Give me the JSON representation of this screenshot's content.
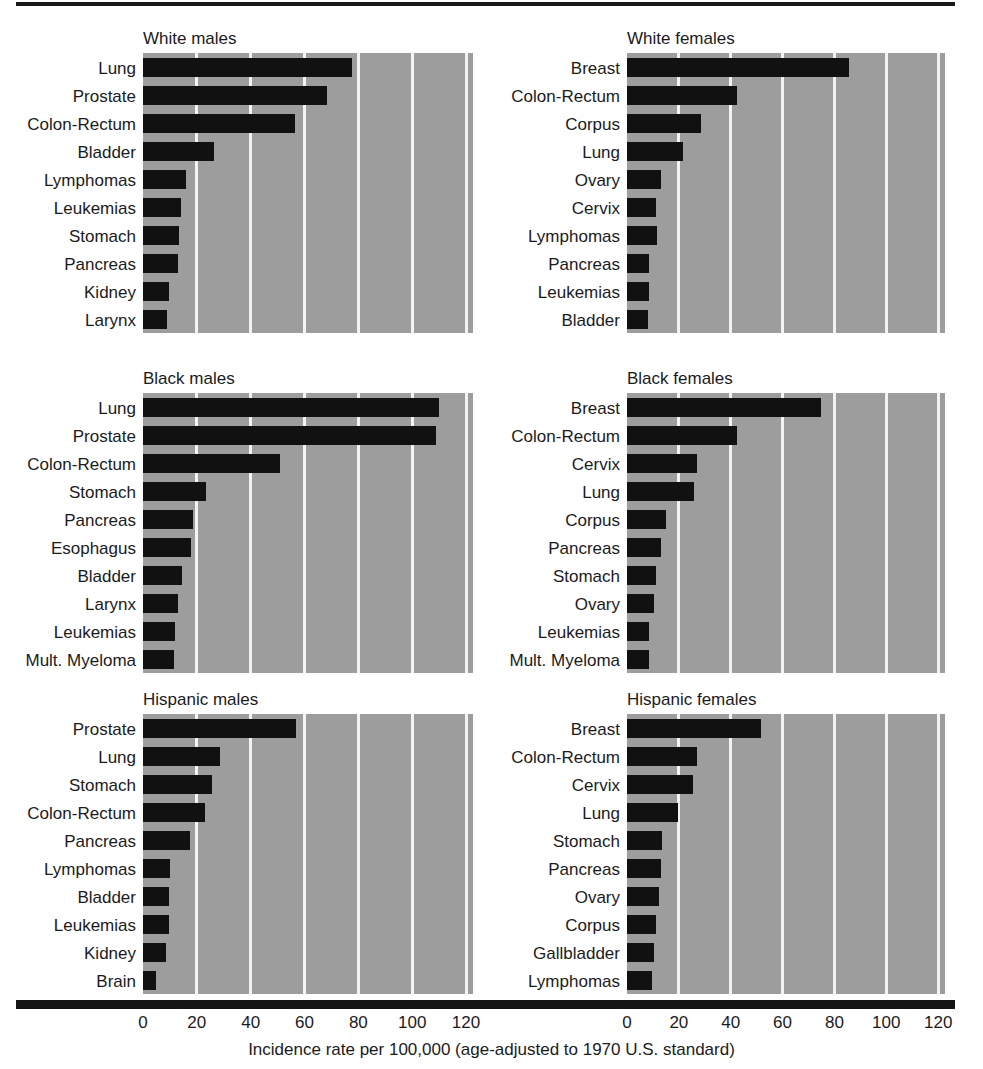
{
  "figure": {
    "axis_caption": "Incidence rate per 100,000 (age-adjusted to 1970 U.S. standard)",
    "tick_labels": [
      "0",
      "20",
      "40",
      "60",
      "80",
      "100",
      "120"
    ]
  },
  "chart_data": {
    "type": "bar",
    "title": "",
    "xlabel": "Incidence rate per 100,000 (age-adjusted to 1970 U.S. standard)",
    "ylabel": "",
    "xlim": [
      0,
      130
    ],
    "xticks": [
      0,
      20,
      40,
      60,
      80,
      100,
      120
    ],
    "grid": true,
    "orientation": "horizontal",
    "legend": "none",
    "panel_layout": "3 rows x 2 columns",
    "panels": [
      {
        "title": "White males",
        "row": 0,
        "column": 0,
        "categories": [
          "Lung",
          "Prostate",
          "Colon-Rectum",
          "Bladder",
          "Lymphomas",
          "Leukemias",
          "Stomach",
          "Pancreas",
          "Kidney",
          "Larynx"
        ],
        "values": [
          77.5,
          68.5,
          56.5,
          26.5,
          16.0,
          14.0,
          13.5,
          13.0,
          9.5,
          9.0
        ]
      },
      {
        "title": "White females",
        "row": 0,
        "column": 1,
        "categories": [
          "Breast",
          "Colon-Rectum",
          "Corpus",
          "Lung",
          "Ovary",
          "Cervix",
          "Lymphomas",
          "Pancreas",
          "Leukemias",
          "Bladder"
        ],
        "values": [
          85.5,
          42.5,
          28.5,
          21.5,
          13.0,
          11.0,
          11.5,
          8.5,
          8.5,
          8.0
        ]
      },
      {
        "title": "Black males",
        "row": 1,
        "column": 0,
        "categories": [
          "Lung",
          "Prostate",
          "Colon-Rectum",
          "Stomach",
          "Pancreas",
          "Esophagus",
          "Bladder",
          "Larynx",
          "Leukemias",
          "Mult. Myeloma"
        ],
        "values": [
          110.0,
          109.0,
          51.0,
          23.5,
          18.5,
          18.0,
          14.5,
          13.0,
          12.0,
          11.5
        ]
      },
      {
        "title": "Black females",
        "row": 1,
        "column": 1,
        "categories": [
          "Breast",
          "Colon-Rectum",
          "Cervix",
          "Lung",
          "Corpus",
          "Pancreas",
          "Stomach",
          "Ovary",
          "Leukemias",
          "Mult. Myeloma"
        ],
        "values": [
          75.0,
          42.5,
          27.0,
          26.0,
          15.0,
          13.0,
          11.0,
          10.5,
          8.5,
          8.5
        ]
      },
      {
        "title": "Hispanic males",
        "row": 2,
        "column": 0,
        "categories": [
          "Prostate",
          "Lung",
          "Stomach",
          "Colon-Rectum",
          "Pancreas",
          "Lymphomas",
          "Bladder",
          "Leukemias",
          "Kidney",
          "Brain"
        ],
        "values": [
          57.0,
          28.5,
          25.5,
          23.0,
          17.5,
          10.0,
          9.5,
          9.5,
          8.5,
          5.0
        ]
      },
      {
        "title": "Hispanic females",
        "row": 2,
        "column": 1,
        "categories": [
          "Breast",
          "Colon-Rectum",
          "Cervix",
          "Lung",
          "Stomach",
          "Pancreas",
          "Ovary",
          "Corpus",
          "Gallbladder",
          "Lymphomas"
        ],
        "values": [
          51.5,
          27.0,
          25.5,
          19.5,
          13.5,
          13.0,
          12.5,
          11.0,
          10.5,
          9.5
        ]
      }
    ]
  }
}
